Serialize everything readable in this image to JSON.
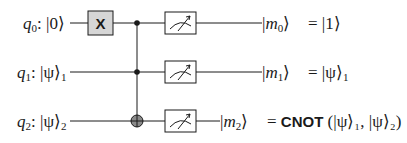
{
  "diagram": {
    "type": "quantum-circuit",
    "qubits": [
      {
        "name": "q",
        "index": "0",
        "init_state": "|0⟩",
        "output_state": "m",
        "output_index": "0",
        "result": "= |1⟩"
      },
      {
        "name": "q",
        "index": "1",
        "init_state": "|ψ⟩",
        "init_sub": "1",
        "output_state": "m",
        "output_index": "1",
        "result": "= |ψ⟩",
        "result_sub": "1"
      },
      {
        "name": "q",
        "index": "2",
        "init_state": "|ψ⟩",
        "init_sub": "2",
        "output_state": "m",
        "output_index": "2",
        "result_prefix": "= ",
        "result_bold": "CNOT",
        "result_args": "(|ψ⟩₁, |ψ⟩₂)"
      }
    ],
    "gates": [
      {
        "type": "X",
        "label": "X",
        "qubit": 0
      },
      {
        "type": "Toffoli",
        "controls": [
          0,
          1
        ],
        "target": 2
      },
      {
        "type": "measure",
        "qubits": [
          0,
          1,
          2
        ]
      }
    ],
    "colors": {
      "wire": "#1a1a1a",
      "gate_fill": "#d6d6d6",
      "target_fill": "#8a8a8a",
      "background": "#ffffff"
    }
  }
}
